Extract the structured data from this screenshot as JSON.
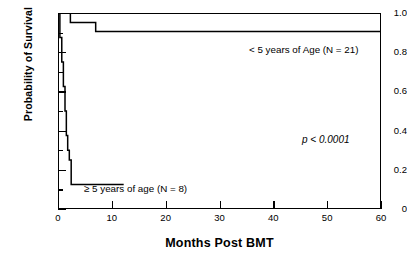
{
  "figure": {
    "kind": "kaplan-meier-survival-plot"
  },
  "chart_data": {
    "type": "line",
    "title": "",
    "xlabel": "Months Post BMT",
    "ylabel": "Probability of Survival",
    "xlim": [
      0,
      60
    ],
    "ylim": [
      0,
      1.0
    ],
    "grid": false,
    "legend_position": "inline-annotations",
    "xticks": [
      0,
      10,
      20,
      30,
      40,
      50,
      60
    ],
    "xtick_labels": [
      "0",
      "10",
      "20",
      "30",
      "40",
      "50",
      "60"
    ],
    "yticks": [
      0,
      0.2,
      0.4,
      0.6,
      0.8,
      1.0
    ],
    "ytick_labels": [
      "0",
      "0.2",
      "0.4",
      "0.6",
      "0.8",
      "1.0"
    ],
    "yticks_minor": [
      0.1,
      0.3,
      0.5,
      0.7,
      0.9
    ],
    "annotations": [
      {
        "name": "upper-curve-label",
        "text": "< 5 years of Age (N = 21)",
        "x": 36.0,
        "y": 0.845
      },
      {
        "name": "lower-curve-label",
        "text": "≥ 5 years of age (N = 8)",
        "x": 6.0,
        "y": 0.175
      },
      {
        "name": "p-value",
        "text": "p < 0.0001",
        "x": 48.5,
        "y": 0.4
      }
    ],
    "series": [
      {
        "name": "< 5 years of Age (N = 21)",
        "n": 21,
        "color": "#000000",
        "step": "post",
        "x": [
          0,
          2.3,
          2.3,
          7.0,
          7.0,
          60.0
        ],
        "y": [
          1.0,
          1.0,
          0.952,
          0.952,
          0.905,
          0.905
        ]
      },
      {
        "name": "≥ 5 years of age (N = 8)",
        "n": 8,
        "color": "#000000",
        "step": "post",
        "x": [
          0,
          0.35,
          0.35,
          0.7,
          0.7,
          1.0,
          1.0,
          1.3,
          1.3,
          1.55,
          1.55,
          1.8,
          1.8,
          2.1,
          2.1,
          2.45,
          2.45,
          12.2
        ],
        "y": [
          1.0,
          1.0,
          0.875,
          0.875,
          0.75,
          0.75,
          0.625,
          0.625,
          0.5,
          0.5,
          0.375,
          0.375,
          0.3,
          0.3,
          0.25,
          0.25,
          0.125,
          0.125
        ]
      }
    ]
  },
  "axes": {
    "y_title": "Probability of Survival",
    "x_title": "Months Post BMT"
  }
}
